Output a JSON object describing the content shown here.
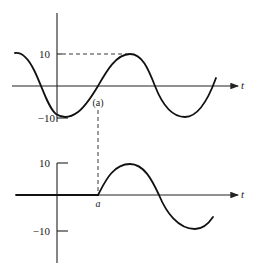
{
  "top_plot": {
    "y_tick_high": "10",
    "y_tick_low": "−10",
    "x_axis_label": "t",
    "crossing_label": "(a)"
  },
  "bottom_plot": {
    "y_tick_high": "10",
    "y_tick_low": "−10",
    "x_axis_label": "t",
    "start_label": "a"
  },
  "colors": {
    "line": "#111111",
    "background": "#ffffff"
  }
}
